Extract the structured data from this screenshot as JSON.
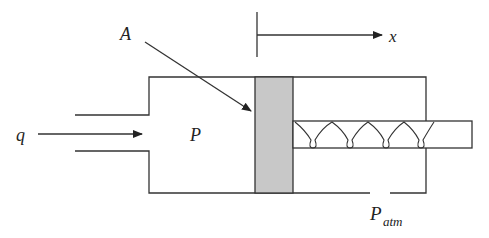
{
  "diagram": {
    "type": "hydraulic-cylinder-schematic",
    "labels": {
      "area": "A",
      "displacement": "x",
      "flow": "q",
      "pressure": "P",
      "atm_main": "P",
      "atm_sub": "atm"
    },
    "colors": {
      "stroke": "#333333",
      "piston_fill": "#c8c8c8",
      "background": "#ffffff"
    }
  }
}
